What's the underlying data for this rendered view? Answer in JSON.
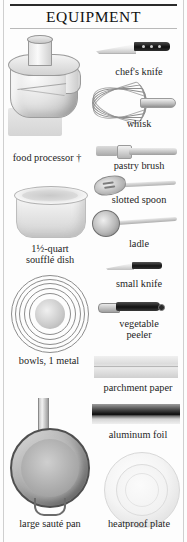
{
  "page": {
    "title": "EQUIPMENT",
    "background_color": "#fdfdfd",
    "rule_color": "#2b2b2b"
  },
  "items": [
    {
      "key": "food_processor",
      "label": "food processor †",
      "icon": "food-processor-illustration",
      "column": "left"
    },
    {
      "key": "chefs_knife",
      "label": "chef's knife",
      "icon": "chefs-knife-illustration",
      "column": "right"
    },
    {
      "key": "whisk",
      "label": "whisk",
      "icon": "whisk-illustration",
      "column": "right"
    },
    {
      "key": "pastry_brush",
      "label": "pastry brush",
      "icon": "pastry-brush-illustration",
      "column": "right"
    },
    {
      "key": "slotted_spoon",
      "label": "slotted spoon",
      "icon": "slotted-spoon-illustration",
      "column": "right"
    },
    {
      "key": "souffle_dish",
      "label": "1½-quart\nsoufflé dish",
      "icon": "souffle-dish-illustration",
      "column": "left"
    },
    {
      "key": "ladle",
      "label": "ladle",
      "icon": "ladle-illustration",
      "column": "right"
    },
    {
      "key": "small_knife",
      "label": "small knife",
      "icon": "small-knife-illustration",
      "column": "right"
    },
    {
      "key": "vegetable_peeler",
      "label": "vegetable\npeeler",
      "icon": "vegetable-peeler-illustration",
      "column": "right"
    },
    {
      "key": "bowls",
      "label": "bowls, 1 metal",
      "icon": "nested-bowls-illustration",
      "column": "left"
    },
    {
      "key": "parchment_paper",
      "label": "parchment paper",
      "icon": "parchment-paper-illustration",
      "column": "right"
    },
    {
      "key": "aluminum_foil",
      "label": "aluminum foil",
      "icon": "aluminum-foil-illustration",
      "column": "right"
    },
    {
      "key": "saute_pan",
      "label": "large sauté pan",
      "icon": "saute-pan-illustration",
      "column": "left"
    },
    {
      "key": "heatproof_plate",
      "label": "heatproof plate",
      "icon": "heatproof-plate-illustration",
      "column": "right"
    }
  ]
}
